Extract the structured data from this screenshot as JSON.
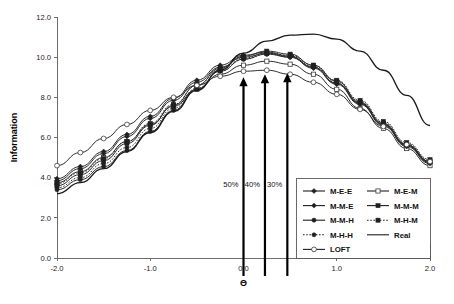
{
  "chart_data": {
    "type": "line",
    "title": "",
    "xlabel": "Θ",
    "ylabel": "Information",
    "xlim": [
      -2.0,
      2.0
    ],
    "ylim": [
      0.0,
      12.0
    ],
    "xticks": [
      "-2.0",
      "-1.0",
      "0.0",
      "1.0",
      "2.0"
    ],
    "xtick_values": [
      -2.0,
      -1.0,
      0.0,
      1.0,
      2.0
    ],
    "yticks": [
      "0.0",
      "2.0",
      "4.0",
      "6.0",
      "8.0",
      "10.0",
      "12.0"
    ],
    "ytick_values": [
      0.0,
      2.0,
      4.0,
      6.0,
      8.0,
      10.0,
      12.0
    ],
    "grid": false,
    "legend_position": "bottom-right",
    "x": [
      -2.0,
      -1.75,
      -1.5,
      -1.25,
      -1.0,
      -0.75,
      -0.5,
      -0.25,
      0.0,
      0.25,
      0.5,
      0.75,
      1.0,
      1.25,
      1.5,
      1.75,
      2.0
    ],
    "series": [
      {
        "name": "M-E-E",
        "marker": "filled-diamond",
        "linestyle": "solid",
        "values": [
          3.95,
          4.55,
          5.3,
          6.15,
          7.05,
          7.95,
          8.85,
          9.6,
          10.1,
          10.25,
          10.05,
          9.5,
          8.7,
          7.7,
          6.65,
          5.6,
          4.75
        ]
      },
      {
        "name": "M-E-M",
        "marker": "open-square",
        "linestyle": "solid",
        "values": [
          3.75,
          4.3,
          5.0,
          5.8,
          6.65,
          7.55,
          8.4,
          9.15,
          9.6,
          9.8,
          9.65,
          9.15,
          8.4,
          7.45,
          6.45,
          5.45,
          4.6
        ]
      },
      {
        "name": "M-M-E",
        "marker": "filled-diamond",
        "linestyle": "solid",
        "values": [
          3.85,
          4.45,
          5.2,
          6.05,
          6.95,
          7.85,
          8.75,
          9.5,
          10.0,
          10.2,
          10.0,
          9.45,
          8.65,
          7.65,
          6.6,
          5.55,
          4.7
        ]
      },
      {
        "name": "M-M-M",
        "marker": "filled-square",
        "linestyle": "solid",
        "values": [
          3.6,
          4.15,
          4.85,
          5.7,
          6.6,
          7.6,
          8.6,
          9.45,
          10.05,
          10.3,
          10.15,
          9.6,
          8.8,
          7.75,
          6.7,
          5.65,
          4.8
        ]
      },
      {
        "name": "M-M-H",
        "marker": "filled-circle",
        "linestyle": "solid",
        "values": [
          3.4,
          3.9,
          4.55,
          5.35,
          6.3,
          7.35,
          8.4,
          9.3,
          9.9,
          10.15,
          10.0,
          9.5,
          8.7,
          7.7,
          6.65,
          5.6,
          4.75
        ]
      },
      {
        "name": "M-H-M",
        "marker": "filled-square",
        "linestyle": "dotted",
        "values": [
          3.7,
          4.25,
          4.95,
          5.8,
          6.7,
          7.65,
          8.6,
          9.4,
          9.95,
          10.2,
          10.1,
          9.6,
          8.85,
          7.85,
          6.8,
          5.75,
          4.9
        ]
      },
      {
        "name": "M-H-H",
        "marker": "filled-circle",
        "linestyle": "dotted",
        "values": [
          3.5,
          4.0,
          4.7,
          5.5,
          6.45,
          7.45,
          8.45,
          9.3,
          9.9,
          10.15,
          10.05,
          9.55,
          8.8,
          7.8,
          6.75,
          5.7,
          4.85
        ]
      },
      {
        "name": "LOFT",
        "marker": "open-circle",
        "linestyle": "solid",
        "values": [
          4.6,
          5.25,
          5.95,
          6.65,
          7.35,
          8.0,
          8.6,
          9.05,
          9.3,
          9.35,
          9.15,
          8.75,
          8.15,
          7.4,
          6.55,
          5.65,
          4.8
        ]
      },
      {
        "name": "Real",
        "marker": "none",
        "linestyle": "solid",
        "values": [
          3.2,
          3.75,
          4.45,
          5.3,
          6.25,
          7.3,
          8.35,
          9.35,
          10.2,
          10.8,
          11.1,
          11.15,
          10.9,
          10.3,
          9.35,
          8.1,
          6.6
        ]
      }
    ],
    "annotations": [
      {
        "label": "50%",
        "x": 0.0,
        "tip_y": 9.0
      },
      {
        "label": "40%",
        "x": 0.23,
        "tip_y": 9.15
      },
      {
        "label": "30%",
        "x": 0.47,
        "tip_y": 9.2
      }
    ],
    "legend": {
      "left_column": [
        "M-E-E",
        "M-M-E",
        "M-M-H",
        "M-H-H",
        "LOFT"
      ],
      "right_column": [
        "M-E-M",
        "M-M-M",
        "M-H-M",
        "Real"
      ]
    },
    "colors": {
      "line": "#2b2b2b",
      "axis": "#6e6e6e",
      "text": "#111111",
      "annotation": "#000000"
    }
  }
}
